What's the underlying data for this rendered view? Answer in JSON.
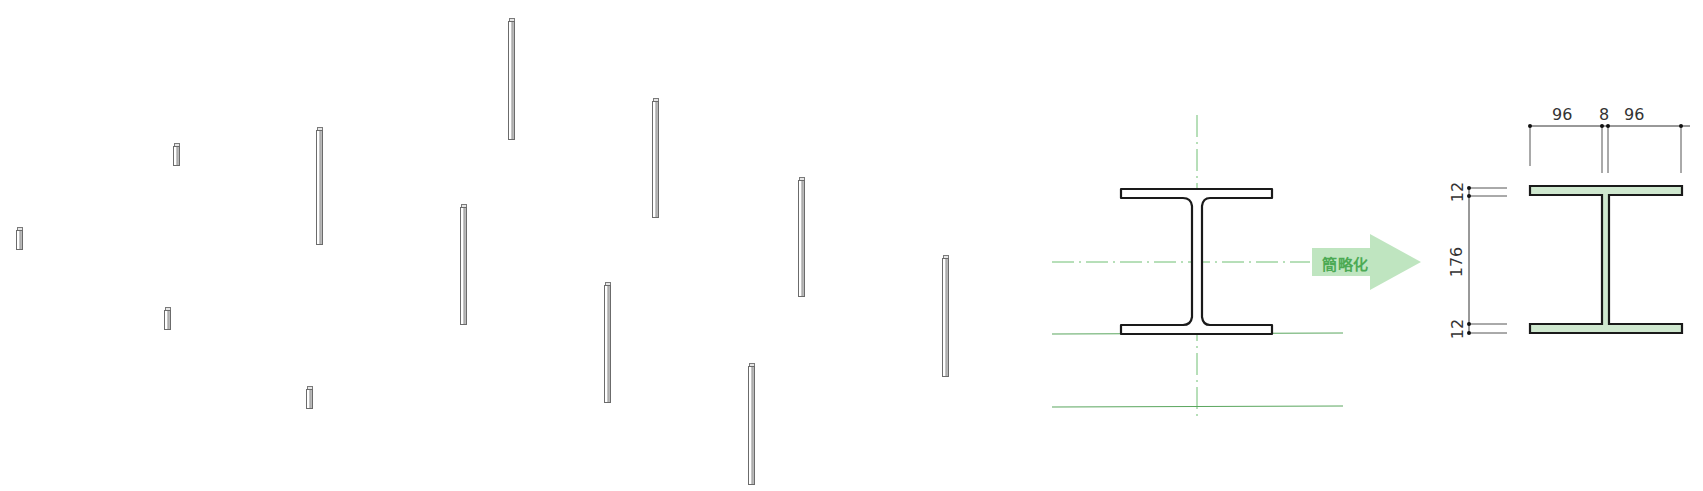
{
  "diagram": {
    "title": "",
    "isometric_columns": {
      "description": "Isometric arrangement of H-section steel columns",
      "items": [
        {
          "x": 19,
          "top": 230,
          "bottom": 250,
          "type": "short"
        },
        {
          "x": 176,
          "top": 146,
          "bottom": 166,
          "type": "short"
        },
        {
          "x": 167,
          "top": 310,
          "bottom": 330,
          "type": "short"
        },
        {
          "x": 309,
          "top": 389,
          "bottom": 409,
          "type": "short"
        },
        {
          "x": 319,
          "top": 130,
          "bottom": 245,
          "type": "tall"
        },
        {
          "x": 511,
          "top": 21,
          "bottom": 140,
          "type": "tall"
        },
        {
          "x": 463,
          "top": 207,
          "bottom": 325,
          "type": "tall"
        },
        {
          "x": 655,
          "top": 101,
          "bottom": 218,
          "type": "tall"
        },
        {
          "x": 607,
          "top": 285,
          "bottom": 403,
          "type": "tall"
        },
        {
          "x": 801,
          "top": 180,
          "bottom": 297,
          "type": "tall"
        },
        {
          "x": 751,
          "top": 366,
          "bottom": 485,
          "type": "tall"
        },
        {
          "x": 945,
          "top": 258,
          "bottom": 377,
          "type": "tall"
        }
      ]
    },
    "original_section": {
      "label": "Rolled H-section with fillets",
      "has_centerlines": true
    },
    "arrow": {
      "label": "簡略化",
      "color": "#a8dcaa",
      "text_color": "#4caa54"
    },
    "simplified_section": {
      "fill_color": "#cfe8cf",
      "dimensions": {
        "top": [
          "96",
          "8",
          "96"
        ],
        "left": [
          "12",
          "176",
          "12"
        ]
      }
    }
  },
  "colors": {
    "line": "#222222",
    "centerline": "#6fbf73",
    "gridline": "#5aa65e",
    "fill_green": "#cfe8cf"
  }
}
